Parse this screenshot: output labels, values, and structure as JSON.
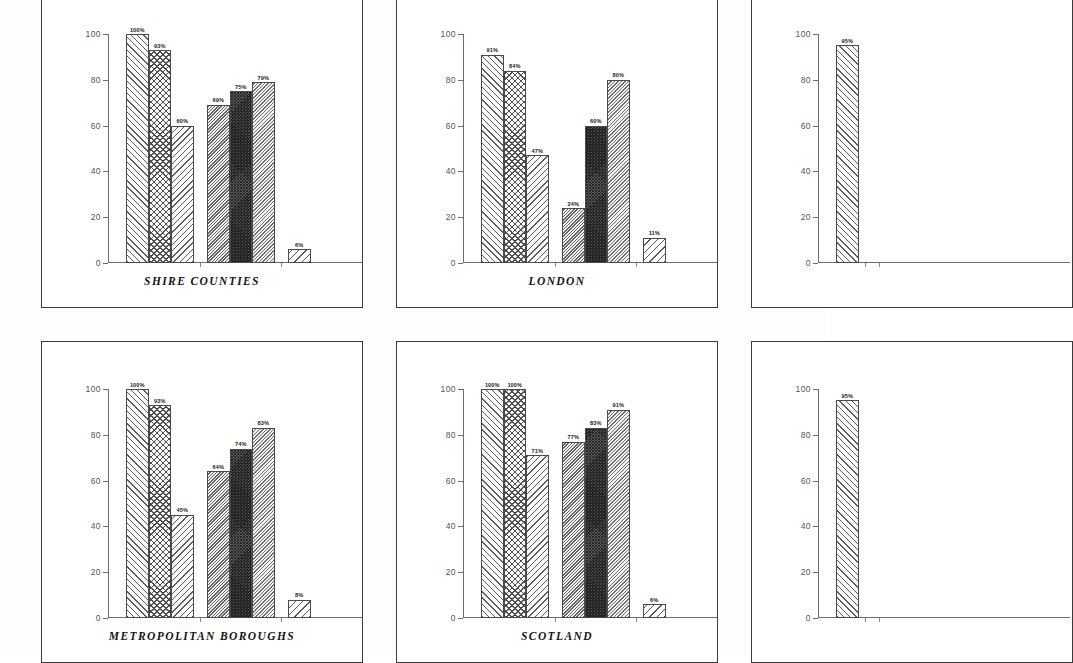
{
  "page": {
    "background": "#fdfdfd",
    "axis_color": "#6e6e6e",
    "border_color": "#3a3a3a"
  },
  "chart_data": [
    {
      "id": "shire-counties",
      "type": "bar",
      "title": "SHIRE COUNTIES",
      "xlabel": "",
      "ylabel": "",
      "ylim": [
        0,
        100
      ],
      "yticks": [
        0,
        20,
        40,
        60,
        80,
        100
      ],
      "ytick_labels": [
        "0",
        "20",
        "40",
        "60",
        "80",
        "100"
      ],
      "grid": false,
      "legend": "none",
      "categories": [
        "1",
        "2",
        "3",
        "4",
        "5",
        "6",
        "7"
      ],
      "values": [
        100,
        93,
        60,
        69,
        75,
        79,
        6
      ],
      "labels": [
        "100%",
        "93%",
        "60%",
        "69%",
        "75%",
        "79%",
        "6%"
      ],
      "patterns": [
        "p-hatch-f",
        "p-cross",
        "p-hatch-b",
        "p-dense-m",
        "p-dense-d",
        "p-dense-l",
        "p-hatch-w"
      ],
      "partial": false
    },
    {
      "id": "london",
      "type": "bar",
      "title": "LONDON",
      "xlabel": "",
      "ylabel": "",
      "ylim": [
        0,
        100
      ],
      "yticks": [
        0,
        20,
        40,
        60,
        80,
        100
      ],
      "ytick_labels": [
        "0",
        "20",
        "40",
        "60",
        "80",
        "100"
      ],
      "grid": false,
      "legend": "none",
      "categories": [
        "1",
        "2",
        "3",
        "4",
        "5",
        "6",
        "7"
      ],
      "values": [
        91,
        84,
        47,
        24,
        60,
        80,
        11
      ],
      "labels": [
        "91%",
        "84%",
        "47%",
        "24%",
        "60%",
        "80%",
        "11%"
      ],
      "patterns": [
        "p-hatch-f",
        "p-cross",
        "p-hatch-b",
        "p-dense-m",
        "p-dense-d",
        "p-dense-l",
        "p-hatch-w"
      ],
      "partial": false
    },
    {
      "id": "right-top-partial",
      "type": "bar",
      "title": "",
      "xlabel": "",
      "ylabel": "",
      "ylim": [
        0,
        100
      ],
      "yticks": [
        0,
        20,
        40,
        60,
        80,
        100
      ],
      "ytick_labels": [
        "0",
        "20",
        "40",
        "60",
        "80",
        "100"
      ],
      "grid": false,
      "legend": "none",
      "categories": [
        "1"
      ],
      "values": [
        95
      ],
      "labels": [
        "95%"
      ],
      "patterns": [
        "p-hatch-f"
      ],
      "partial": true
    },
    {
      "id": "metropolitan-boroughs",
      "type": "bar",
      "title": "METROPOLITAN BOROUGHS",
      "xlabel": "",
      "ylabel": "",
      "ylim": [
        0,
        100
      ],
      "yticks": [
        0,
        20,
        40,
        60,
        80,
        100
      ],
      "ytick_labels": [
        "0",
        "20",
        "40",
        "60",
        "80",
        "100"
      ],
      "grid": false,
      "legend": "none",
      "categories": [
        "1",
        "2",
        "3",
        "4",
        "5",
        "6",
        "7"
      ],
      "values": [
        100,
        93,
        45,
        64,
        74,
        83,
        8
      ],
      "labels": [
        "100%",
        "93%",
        "45%",
        "64%",
        "74%",
        "83%",
        "8%"
      ],
      "patterns": [
        "p-hatch-f",
        "p-cross",
        "p-hatch-b",
        "p-dense-m",
        "p-dense-d",
        "p-dense-l",
        "p-hatch-w"
      ],
      "partial": false
    },
    {
      "id": "scotland",
      "type": "bar",
      "title": "SCOTLAND",
      "xlabel": "",
      "ylabel": "",
      "ylim": [
        0,
        100
      ],
      "yticks": [
        0,
        20,
        40,
        60,
        80,
        100
      ],
      "ytick_labels": [
        "0",
        "20",
        "40",
        "60",
        "80",
        "100"
      ],
      "grid": false,
      "legend": "none",
      "categories": [
        "1",
        "2",
        "3",
        "4",
        "5",
        "6",
        "7"
      ],
      "values": [
        100,
        100,
        71,
        77,
        83,
        91,
        6
      ],
      "labels": [
        "100%",
        "100%",
        "71%",
        "77%",
        "83%",
        "91%",
        "6%"
      ],
      "patterns": [
        "p-hatch-f",
        "p-cross",
        "p-hatch-b",
        "p-dense-m",
        "p-dense-d",
        "p-dense-l",
        "p-hatch-w"
      ],
      "partial": false
    },
    {
      "id": "right-bottom-partial",
      "type": "bar",
      "title": "",
      "xlabel": "",
      "ylabel": "",
      "ylim": [
        0,
        100
      ],
      "yticks": [
        0,
        20,
        40,
        60,
        80,
        100
      ],
      "ytick_labels": [
        "0",
        "20",
        "40",
        "60",
        "80",
        "100"
      ],
      "grid": false,
      "legend": "none",
      "categories": [
        "1"
      ],
      "values": [
        95
      ],
      "labels": [
        "95%"
      ],
      "patterns": [
        "p-hatch-f"
      ],
      "partial": true
    }
  ],
  "layout": {
    "panels": [
      {
        "chart": 0,
        "left": 41,
        "top": -14,
        "width": 322,
        "height": 322
      },
      {
        "chart": 1,
        "left": 396,
        "top": -14,
        "width": 322,
        "height": 322
      },
      {
        "chart": 2,
        "left": 751,
        "top": -14,
        "width": 322,
        "height": 322
      },
      {
        "chart": 3,
        "left": 41,
        "top": 341,
        "width": 322,
        "height": 322
      },
      {
        "chart": 4,
        "left": 396,
        "top": 341,
        "width": 322,
        "height": 322
      },
      {
        "chart": 5,
        "left": 751,
        "top": 341,
        "width": 322,
        "height": 322
      }
    ],
    "plot": {
      "left": 66,
      "top": 47,
      "width": 222,
      "height": 229
    },
    "title_top": 288,
    "bar_geometry": {
      "group_gap": 13.5,
      "bar_width": 22.5,
      "first_bar_x": 18,
      "groups": [
        3,
        3,
        1
      ]
    }
  }
}
